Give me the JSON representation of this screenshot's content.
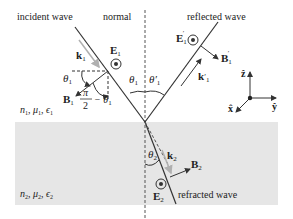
{
  "diagram": {
    "title_labels": {
      "incident": "incident wave",
      "normal": "normal",
      "reflected": "reflected wave",
      "refracted": "refracted wave"
    },
    "medium1": {
      "n": "n",
      "n_sub": "1",
      "mu": "μ",
      "mu_sub": "1",
      "eps": "ϵ",
      "eps_sub": "1"
    },
    "medium2": {
      "n": "n",
      "n_sub": "2",
      "mu": "μ",
      "mu_sub": "2",
      "eps": "ϵ",
      "eps_sub": "2"
    },
    "vectors": {
      "k1": {
        "sym": "k",
        "sub": "1"
      },
      "E1": {
        "sym": "E",
        "sub": "1"
      },
      "B1": {
        "sym": "B",
        "sub": "1"
      },
      "k1p": {
        "sym": "k",
        "sub": "1",
        "prime": "′"
      },
      "E1p": {
        "sym": "E",
        "sub": "1",
        "prime": "′"
      },
      "B1p": {
        "sym": "B",
        "sub": "1",
        "prime": "′"
      },
      "k2": {
        "sym": "k",
        "sub": "2"
      },
      "E2": {
        "sym": "E",
        "sub": "2"
      },
      "B2": {
        "sym": "B",
        "sub": "2"
      }
    },
    "angles": {
      "theta1_left": {
        "sym": "θ",
        "sub": "1"
      },
      "theta1_center": {
        "sym": "θ",
        "sub": "1"
      },
      "theta1p": {
        "sym": "θ′",
        "sub": "1"
      },
      "theta2": {
        "sym": "θ",
        "sub": "2"
      },
      "complement": {
        "num": "π",
        "den": "2",
        "minus": "− θ",
        "sub": "1"
      }
    },
    "axes": {
      "z": "ẑ",
      "y": "ŷ",
      "x": "x̂"
    },
    "colors": {
      "background": "#ffffff",
      "medium2_fill": "#e6e6e6",
      "lines": "#333333",
      "k_arrows": "#b8b8b8"
    }
  }
}
